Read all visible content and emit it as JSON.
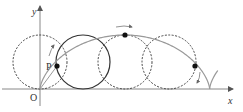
{
  "diagram": {
    "type": "cycloid",
    "colors": {
      "axis": "#888888",
      "curve": "#999999",
      "circle_solid": "#333333",
      "circle_dashed": "#444444",
      "point": "#111111",
      "label": "#333333"
    },
    "geometry": {
      "origin": [
        40,
        89
      ],
      "radius": 27,
      "x_axis_end": 233,
      "y_axis_top": 6,
      "y_axis_bottom": 106
    },
    "labels": {
      "x_axis": "x",
      "y_axis": "y",
      "origin": "O",
      "point": "P"
    },
    "circles": [
      {
        "name": "initial-circle",
        "center_x": 40,
        "style": "dashed",
        "angle": 0
      },
      {
        "name": "rolling-circle-p",
        "center_x": 83,
        "style": "solid",
        "angle": 1.6
      },
      {
        "name": "circle-at-top",
        "center_x": 125,
        "style": "dashed",
        "angle": 3.14159
      },
      {
        "name": "circle-descending",
        "center_x": 169,
        "style": "dashed",
        "angle": 4.76
      }
    ],
    "points": [
      {
        "name": "point-p",
        "x": 57,
        "y": 66,
        "label": "P"
      },
      {
        "name": "point-top",
        "x": 125,
        "y": 35
      },
      {
        "name": "point-descending",
        "x": 195,
        "y": 66
      }
    ],
    "cusp_x": 210,
    "tail_end": [
      231,
      67
    ]
  }
}
